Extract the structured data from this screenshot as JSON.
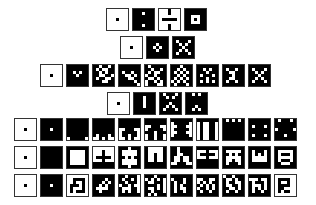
{
  "diagram": {
    "colors": {
      "on": "#000000",
      "off": "#ffffff",
      "border": "#333333"
    },
    "rows": [
      {
        "left": 106,
        "top": 8,
        "tiles": [
          [
            "0000000",
            "0000000",
            "0000000",
            "0001000",
            "0000000",
            "0000000",
            "0000000"
          ],
          [
            "1111111",
            "1110111",
            "1111111",
            "1111111",
            "1111111",
            "1110111",
            "1111111"
          ],
          [
            "0001000",
            "0001000",
            "0000000",
            "0111110",
            "0000000",
            "0001000",
            "0001000"
          ],
          [
            "1111111",
            "1111111",
            "1100011",
            "1101011",
            "1100011",
            "1111111",
            "1111111"
          ]
        ]
      },
      {
        "left": 120,
        "top": 36,
        "tiles": [
          [
            "0000000",
            "0000000",
            "0000000",
            "0001000",
            "0000000",
            "0000000",
            "0000000"
          ],
          [
            "1111111",
            "1111111",
            "1110111",
            "1101011",
            "1110111",
            "1111111",
            "1111111"
          ],
          [
            "1111111",
            "1011101",
            "1101011",
            "1110111",
            "1101011",
            "1011101",
            "1111111"
          ]
        ]
      },
      {
        "left": 40,
        "top": 64,
        "tiles": [
          [
            "0000000",
            "0000000",
            "0000000",
            "0001000",
            "0000000",
            "0000000",
            "0000000"
          ],
          [
            "1111111",
            "1111111",
            "1101011",
            "1110111",
            "1111111",
            "1111111",
            "1111111"
          ],
          [
            "1101101",
            "1010011",
            "1101011",
            "1100110",
            "1011001",
            "1110011",
            "1111111"
          ],
          [
            "1111111",
            "1111111",
            "1011011",
            "1100101",
            "1110011",
            "1111101",
            "1111110"
          ],
          [
            "1011111",
            "1101101",
            "1010011",
            "0110111",
            "1001011",
            "0110101",
            "0111001"
          ],
          [
            "1110111",
            "1101011",
            "1010101",
            "1101011",
            "1010101",
            "0101011",
            "1011101"
          ],
          [
            "1111111",
            "1101011",
            "1110111",
            "1011101",
            "1110111",
            "1010101",
            "1111111"
          ],
          [
            "1111111",
            "1011011",
            "1100111",
            "1110111",
            "1100111",
            "1011011",
            "1111111"
          ],
          [
            "1111111",
            "1011101",
            "1101011",
            "1110111",
            "1101011",
            "1011101",
            "1111111"
          ]
        ]
      },
      {
        "left": 107,
        "top": 92,
        "tiles": [
          [
            "0000000",
            "0000000",
            "0000000",
            "0001000",
            "0000000",
            "0000000",
            "0000000"
          ],
          [
            "1111111",
            "1110111",
            "1110111",
            "1110111",
            "1110111",
            "1111111",
            "1111111"
          ],
          [
            "1011101",
            "1101011",
            "1111111",
            "1110111",
            "1101011",
            "1011101",
            "1111111"
          ],
          [
            "1101011",
            "1111111",
            "1111111",
            "1111111",
            "1110111",
            "1101011",
            "1111111"
          ]
        ]
      },
      {
        "left": 14,
        "top": 118,
        "tiles": [
          [
            "0000000",
            "0000000",
            "0000000",
            "0001000",
            "0000000",
            "0000000",
            "0000000"
          ],
          [
            "1111111",
            "1111111",
            "1111111",
            "1110111",
            "1111111",
            "1111111",
            "1111111"
          ],
          [
            "1111111",
            "1111111",
            "1111111",
            "1111111",
            "1111111",
            "1111111",
            "0111110"
          ],
          [
            "1111111",
            "1111111",
            "1111111",
            "1111111",
            "1111111",
            "1011101",
            "0010100"
          ],
          [
            "1111111",
            "1111111",
            "1111111",
            "0011100",
            "0111110",
            "0110110",
            "0010100"
          ],
          [
            "1111111",
            "1111111",
            "0011100",
            "0111110",
            "1110111",
            "0110110",
            "0110110"
          ],
          [
            "1111111",
            "0111110",
            "0011100",
            "0111110",
            "0011100",
            "0111110",
            "1111111"
          ],
          [
            "1111111",
            "0100110",
            "0100110",
            "0100110",
            "0100110",
            "0100110",
            "0100110"
          ],
          [
            "1010101",
            "1111111",
            "1111111",
            "1111111",
            "1111111",
            "1111111",
            "1111111"
          ],
          [
            "1111111",
            "1111111",
            "1011101",
            "1111111",
            "1111111",
            "1011101",
            "1111111"
          ],
          [
            "1011101",
            "1111111",
            "1111111",
            "0111110",
            "1111111",
            "1110111",
            "1111111"
          ]
        ]
      },
      {
        "left": 14,
        "top": 146,
        "tiles": [
          [
            "0000000",
            "0000000",
            "0000000",
            "0001000",
            "0000000",
            "0000000",
            "0000000"
          ],
          [
            "1111111",
            "1111111",
            "1111111",
            "1111111",
            "1111111",
            "1111111",
            "1111111"
          ],
          [
            "1111111",
            "1000001",
            "1000001",
            "1000001",
            "1000001",
            "1000001",
            "1111111"
          ],
          [
            "0000000",
            "0001000",
            "0001000",
            "0111110",
            "0001000",
            "1111111",
            "1111111"
          ],
          [
            "1110111",
            "1000001",
            "1000001",
            "1101011",
            "1000001",
            "1000001",
            "1110111"
          ],
          [
            "1000001",
            "1000001",
            "1001001",
            "1001001",
            "1001001",
            "1111111",
            "1111111"
          ],
          [
            "1101111",
            "1101111",
            "1100111",
            "1001001",
            "1001001",
            "0011100",
            "1111111"
          ],
          [
            "1111111",
            "0001000",
            "0111110",
            "0001000",
            "1111111",
            "1111111",
            "1111111"
          ],
          [
            "1111111",
            "1000001",
            "1101011",
            "1000001",
            "1001001",
            "1011101",
            "1111111"
          ],
          [
            "1111111",
            "1011101",
            "1010101",
            "1000001",
            "1000001",
            "1111111",
            "1111111"
          ],
          [
            "1111111",
            "1000001",
            "1011101",
            "1000001",
            "1011101",
            "1100011",
            "1111111"
          ]
        ]
      },
      {
        "left": 14,
        "top": 174,
        "tiles": [
          [
            "0000000",
            "0000000",
            "0000000",
            "0001000",
            "0000000",
            "0000000",
            "0000000"
          ],
          [
            "1111111",
            "1111111",
            "1111111",
            "1110111",
            "1111111",
            "1111111",
            "1111111"
          ],
          [
            "0000000",
            "0011110",
            "0010010",
            "0111010",
            "0100010",
            "0101110",
            "0000000"
          ],
          [
            "1111111",
            "1111011",
            "1110101",
            "1101011",
            "1000011",
            "1101111",
            "1111111"
          ],
          [
            "1101110",
            "1011010",
            "1101110",
            "0110100",
            "1000110",
            "1010110",
            "1111111"
          ],
          [
            "1110111",
            "0101010",
            "1001110",
            "1111010",
            "1001010",
            "1101110",
            "1010111"
          ],
          [
            "1111111",
            "0111011",
            "1011011",
            "1010111",
            "1010011",
            "1011011",
            "1111111"
          ],
          [
            "1111111",
            "0011001",
            "0101011",
            "1010101",
            "0110101",
            "1011011",
            "1111111"
          ],
          [
            "0110111",
            "1001011",
            "1011001",
            "1001101",
            "1100101",
            "1011011",
            "1111111"
          ],
          [
            "1111111",
            "0001001",
            "1011101",
            "1000101",
            "1010101",
            "1011011",
            "1111111"
          ],
          [
            "0000000",
            "0111100",
            "0100100",
            "0111100",
            "0110000",
            "0101100",
            "0000000"
          ]
        ]
      }
    ]
  }
}
